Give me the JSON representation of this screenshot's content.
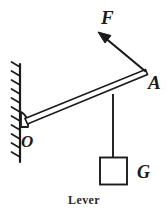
{
  "figure": {
    "caption": "Lever",
    "title": "Lever",
    "background_color": "#ffffff",
    "stroke_color": "#1b1b1b",
    "width": 168,
    "height": 216
  },
  "labels": {
    "force": "F",
    "lever_end": "A",
    "fulcrum": "O",
    "weight": "G"
  },
  "diagram_data": {
    "type": "free-body-diagram",
    "elements": [
      {
        "name": "wall",
        "kind": "hatched-support",
        "x": 20,
        "y_top": 64,
        "y_bottom": 162,
        "hatch_count": 11
      },
      {
        "name": "fulcrum-pivot",
        "kind": "triangle-wedge",
        "x": 22,
        "y": 120
      },
      {
        "name": "lever-bar",
        "kind": "rigid-bar",
        "from": [
          27,
          123
        ],
        "to": [
          146,
          72
        ],
        "thickness": 4
      },
      {
        "name": "force-arrow",
        "kind": "vector-arrow",
        "from": [
          146,
          72
        ],
        "to": [
          99,
          33
        ],
        "label": "F",
        "direction": "up-left"
      },
      {
        "name": "hanging-string",
        "kind": "line",
        "from": [
          113,
          95
        ],
        "to": [
          113,
          157
        ]
      },
      {
        "name": "weight-block",
        "kind": "square",
        "x": 100,
        "y": 157,
        "size": 28,
        "label": "G"
      }
    ]
  }
}
